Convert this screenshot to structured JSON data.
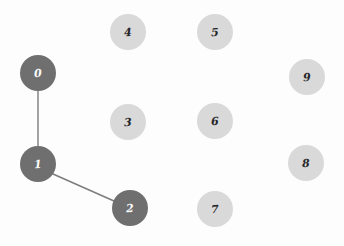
{
  "figure": {
    "type": "node-link-graph",
    "background_color": "#fdfdfd",
    "width": 344,
    "height": 246
  },
  "palette": {
    "node_dark_fill": "#6f6f6f",
    "node_dark_text": "#fcfcfc",
    "node_light_fill": "#d9d9d9",
    "node_light_text": "#26262a",
    "edge_color": "#7c7c7c"
  },
  "chart_data": {
    "type": "graph",
    "title": "",
    "node_count": 10,
    "edge_count": 2,
    "nodes": [
      {
        "id": "0",
        "label": "0",
        "x": 38,
        "y": 73,
        "r": 18,
        "state": "selected",
        "fill": "#6f6f6f",
        "text_color": "#fcfcfc"
      },
      {
        "id": "1",
        "label": "1",
        "x": 38,
        "y": 164,
        "r": 18,
        "state": "selected",
        "fill": "#6f6f6f",
        "text_color": "#fcfcfc"
      },
      {
        "id": "2",
        "label": "2",
        "x": 130,
        "y": 208,
        "r": 18,
        "state": "selected",
        "fill": "#6f6f6f",
        "text_color": "#fcfcfc"
      },
      {
        "id": "3",
        "label": "3",
        "x": 128,
        "y": 122,
        "r": 18,
        "state": "default",
        "fill": "#d9d9d9",
        "text_color": "#26262a"
      },
      {
        "id": "4",
        "label": "4",
        "x": 128,
        "y": 32,
        "r": 18,
        "state": "default",
        "fill": "#d9d9d9",
        "text_color": "#26262a"
      },
      {
        "id": "5",
        "label": "5",
        "x": 215,
        "y": 32,
        "r": 18,
        "state": "default",
        "fill": "#d9d9d9",
        "text_color": "#26262a"
      },
      {
        "id": "6",
        "label": "6",
        "x": 215,
        "y": 121,
        "r": 18,
        "state": "default",
        "fill": "#d9d9d9",
        "text_color": "#26262a"
      },
      {
        "id": "7",
        "label": "7",
        "x": 215,
        "y": 209,
        "r": 18,
        "state": "default",
        "fill": "#d9d9d9",
        "text_color": "#26262a"
      },
      {
        "id": "8",
        "label": "8",
        "x": 306,
        "y": 163,
        "r": 18,
        "state": "default",
        "fill": "#d9d9d9",
        "text_color": "#26262a"
      },
      {
        "id": "9",
        "label": "9",
        "x": 307,
        "y": 77,
        "r": 18,
        "state": "default",
        "fill": "#d9d9d9",
        "text_color": "#26262a"
      }
    ],
    "edges": [
      {
        "source": "0",
        "target": "1",
        "x1": 38,
        "y1": 91,
        "x2": 38,
        "y2": 146,
        "color": "#7c7c7c",
        "width": 1.4
      },
      {
        "source": "1",
        "target": "2",
        "x1": 53,
        "y1": 174,
        "x2": 114,
        "y2": 201,
        "color": "#7c7c7c",
        "width": 1.4
      }
    ]
  }
}
